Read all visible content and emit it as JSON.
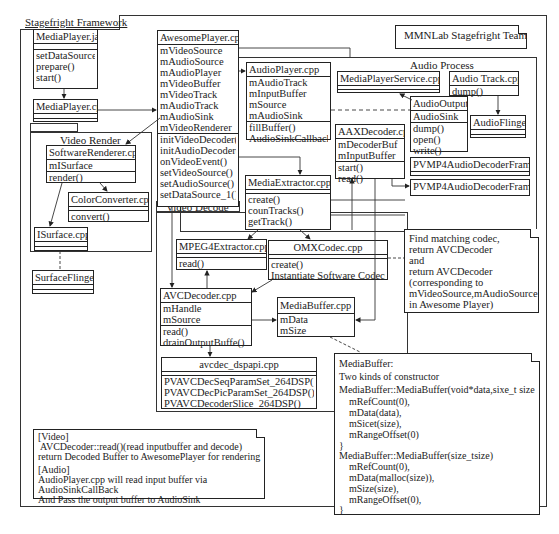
{
  "title_note": "MMNLab Stagefright Team",
  "framework": {
    "label": "Stagefright Framework"
  },
  "packages": {
    "video_render": "Video Render",
    "video_decode": "Video Decode",
    "audio_process": "Audio Process"
  },
  "classes": {
    "mediaplayer_java": {
      "name": "MediaPlayer.java",
      "methods": [
        "setDataSource()",
        "prepare()",
        "start()"
      ]
    },
    "mediaplayer_cpp": {
      "name": "MediaPlayer.cpp"
    },
    "awesomeplayer": {
      "name": "AwesomePlayer.cpp",
      "fields": [
        "mVideoSource",
        "mAudioSource",
        "mAudioPlayer",
        "mVideoBuffer",
        "mVideoTrack",
        "mAudioTrack",
        "mAudioSink",
        "mVideoRenderer"
      ],
      "methods": [
        "initVideoDecoder()",
        "initAudioDecoder()",
        "onVideoEvent()",
        "setVideoSource()",
        "setAudioSource()",
        "setDataSource_1()"
      ]
    },
    "audioplayer": {
      "name": "AudioPlayer.cpp",
      "fields": [
        "mAudioTrack",
        "mInputBuffer",
        "mSource",
        "mAudioSink"
      ],
      "methods": [
        "fillBuffer()",
        "AudioSinkCallback()"
      ]
    },
    "mediaplayerservice": {
      "name": "MediaPlayerService.cpp"
    },
    "audiotrack": {
      "name": "Audio Track.cpp",
      "methods": [
        "dump()"
      ]
    },
    "audiooutput": {
      "name": "AudioOutput",
      "fields": [
        "AudioSink"
      ],
      "methods": [
        "dump()",
        "open()",
        "write()"
      ]
    },
    "audioflinger": {
      "name": "AudioFlinger"
    },
    "aaxdecoder": {
      "name": "AAXDecoder.cpp",
      "fields": [
        "mDecoderBuf",
        "mInputBuffer"
      ],
      "methods": [
        "start()",
        "read()"
      ]
    },
    "pvmp4_frame_cpp": {
      "name": "PVMP4AudioDecoderFrame.cpp"
    },
    "pvmp4_frame_fn": {
      "name": "PVMP4AudioDecoderFrame()"
    },
    "softwarerenderer": {
      "name": "SoftwareRenderer.cpp",
      "fields": [
        "mISurface"
      ],
      "methods": [
        "render()"
      ]
    },
    "colorconverter": {
      "name": "ColorConverter.cpp",
      "methods": [
        "convert()"
      ]
    },
    "isurface": {
      "name": "ISurface.cpp"
    },
    "surfaceflinger": {
      "name": "SurfaceFlinger"
    },
    "mediaextractor": {
      "name": "MediaExtractor.cpp",
      "methods": [
        "create()",
        "counTracks()",
        "getTrack()"
      ]
    },
    "mpeg4extractor": {
      "name": "MPEG4Extractor.cpp",
      "methods": [
        "read()"
      ]
    },
    "omxcodec": {
      "name": "OMXCodec.cpp",
      "methods": [
        "create()",
        "Instantiate Software Codec()"
      ]
    },
    "avcdecoder": {
      "name": "AVCDecoder.cpp",
      "fields": [
        "mHandle",
        "mSource"
      ],
      "methods": [
        "read()",
        "drainOutputBuffe()"
      ]
    },
    "mediabuffer": {
      "name": "MediaBuffer.cpp",
      "fields": [
        "mData",
        "mSize"
      ]
    },
    "avcdec_dspapi": {
      "name": "avcdec_dspapi.cpp",
      "methods": [
        "PVAVCDecSeqParamSet_264DSP()",
        "PVAVCDecPicParamSet_264DSP()",
        "PVAVCDecoderSlice_264DSP()"
      ]
    }
  },
  "notes": {
    "codec": [
      "Find matching codec,",
      "return AVCDecoder",
      "and",
      "return AVCDecoder",
      "(corresponding to",
      " mVideoSource,mAudioSource",
      "in Awesome Player)"
    ],
    "mediabuffer": [
      "MediaBuffer:",
      "Two kinds of constructor",
      "MediaBuffer::MediaBuffer(void*data,sixe_t size",
      "  mRefCount(0),",
      "  mData(data),",
      "  mSicet(size),",
      "  mRangeOffset(0)",
      "}",
      "MediaBuffer::MediaBuffer(size_tsize)",
      "  mRefCount(0),",
      "  mData(malloc(size)),",
      "  mSize(size),",
      "  mRangeOffset(0),",
      "}"
    ],
    "flow": [
      "[Video]",
      "AVCDecoder::read()(read inputbuffer and decode)",
      "return Decoded Buffer to AwesomePlayer for rendering",
      "[Audio]",
      "AudioPlayer.cpp will read input buffer via",
      "AudioSinkCallBack",
      "And Pass the output buffer to AudioSink"
    ]
  }
}
